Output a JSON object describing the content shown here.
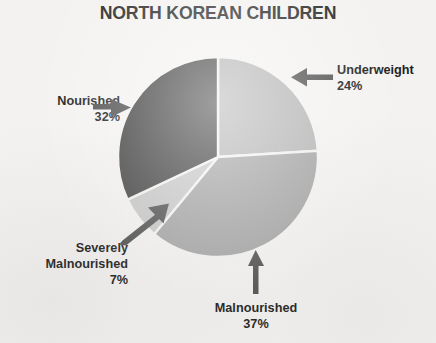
{
  "chart_data": {
    "type": "pie",
    "title": "NORTH KOREAN CHILDREN",
    "categories": [
      "Underweight",
      "Malnourished",
      "Severely Malnourished",
      "Nourished"
    ],
    "values": [
      24,
      37,
      7,
      32
    ],
    "value_unit": "%",
    "start_angle_deg": 0,
    "direction": "clockwise",
    "legend": "none",
    "grid": false,
    "slice_colors": [
      "#b4b4b4",
      "#a3a3a3",
      "#c6c6c6",
      "#404040"
    ],
    "labels": [
      {
        "name": "Underweight",
        "percent": "24%",
        "arrow": "left"
      },
      {
        "name": "Malnourished",
        "percent": "37%",
        "arrow": "up"
      },
      {
        "name": "Severely Malnourished",
        "percent": "7%",
        "arrow": "up-right"
      },
      {
        "name": "Nourished",
        "percent": "32%",
        "arrow": "right"
      }
    ]
  },
  "title": "NORTH KOREAN CHILDREN",
  "callouts": {
    "underweight": {
      "name": "Underweight",
      "percent": "24%"
    },
    "nourished": {
      "name": "Nourished",
      "percent": "32%"
    },
    "severely": {
      "line1": "Severely",
      "line2": "Malnourished",
      "percent": "7%"
    },
    "malnourished": {
      "name": "Malnourished",
      "percent": "37%"
    }
  },
  "colors": {
    "background": "#f3f2f0",
    "text": "#1d1d1d",
    "slice_underweight": "#b4b4b4",
    "slice_malnourished": "#a3a3a3",
    "slice_severely": "#c6c6c6",
    "slice_nourished": "#404040",
    "slice_divider": "#f3f2f0",
    "arrow": "#4a4a4a"
  }
}
